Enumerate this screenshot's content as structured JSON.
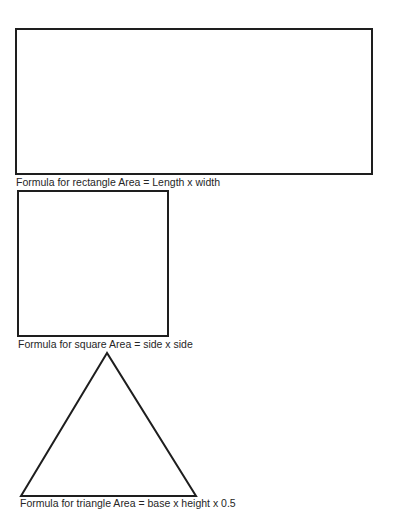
{
  "shapes": {
    "rectangle": {
      "caption": "Formula for rectangle Area = Length x width"
    },
    "square": {
      "caption": "Formula for square Area = side x side"
    },
    "triangle": {
      "caption": "Formula for triangle Area = base x height x 0.5"
    }
  },
  "colors": {
    "stroke": "#1e1e1e",
    "text": "#262626",
    "background": "#ffffff"
  }
}
